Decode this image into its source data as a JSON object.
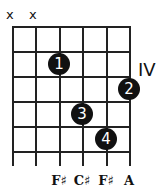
{
  "chord": {
    "position_label": "IV",
    "muted_strings": [
      "x",
      "x"
    ],
    "fingers": [
      {
        "label": "1",
        "string": 3,
        "fret": 2
      },
      {
        "label": "2",
        "string": 6,
        "fret": 3
      },
      {
        "label": "3",
        "string": 4,
        "fret": 4
      },
      {
        "label": "4",
        "string": 5,
        "fret": 5
      }
    ],
    "notes": [
      "F♯",
      "C♯",
      "F♯",
      "A"
    ]
  }
}
